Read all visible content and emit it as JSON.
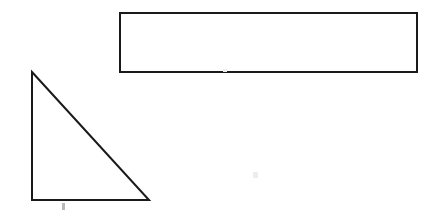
{
  "page": {
    "width": 435,
    "height": 215,
    "background_color": "#ffffff",
    "ink_color": "#1a1a1a",
    "stroke_width": 2
  },
  "figures": {
    "rectangle": {
      "label": "rectangle",
      "x": 120,
      "y": 13,
      "width": 297,
      "height": 59,
      "points": "120,13 417,13 417,72 120,72",
      "fill": "none",
      "stroke": "#1a1a1a"
    },
    "triangle": {
      "label": "right-triangle",
      "apex": [
        32,
        72
      ],
      "bottom_left": [
        32,
        200
      ],
      "bottom_right": [
        149,
        200
      ],
      "points": "32,72 149,200 32,200",
      "fill": "none",
      "stroke": "#1a1a1a"
    }
  },
  "artifacts": {
    "base_mark": {
      "label": "faint-mark-below-base",
      "x": 62,
      "y": 203,
      "width": 3,
      "height": 7,
      "color": "#b8b8b8"
    },
    "rect_edge_speck": {
      "label": "faint-speck-on-rectangle-edge",
      "x": 223,
      "y": 69,
      "width": 4,
      "height": 3,
      "color": "#ededed"
    },
    "lower_mid_speck": {
      "label": "faint-background-speck",
      "x": 253,
      "y": 172,
      "width": 5,
      "height": 6,
      "color": "#ededed"
    }
  }
}
